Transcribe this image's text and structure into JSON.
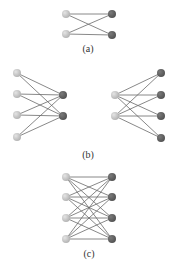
{
  "colors": {
    "background": "#ffffff",
    "edge": "#6a6a6a",
    "light_node": "#b5b5b5",
    "light_node_highlight": "#e4e4e4",
    "dark_node": "#545454",
    "dark_node_highlight": "#7a7a7a",
    "caption": "#333333"
  },
  "node_radius": 4,
  "panels": [
    {
      "id": "a",
      "caption": "(a)",
      "caption_pos": [
        88,
        45
      ],
      "light_nodes": [
        [
          66,
          14
        ],
        [
          66,
          34
        ]
      ],
      "dark_nodes": [
        [
          112,
          14
        ],
        [
          112,
          35
        ]
      ],
      "edges": "complete"
    },
    {
      "id": "b-left",
      "caption": "",
      "light_nodes": [
        [
          17,
          73
        ],
        [
          17,
          94
        ],
        [
          17,
          115
        ],
        [
          17,
          137
        ]
      ],
      "dark_nodes": [
        [
          63,
          95
        ],
        [
          63,
          116
        ]
      ],
      "edges": "complete"
    },
    {
      "id": "b-right",
      "caption": "",
      "light_nodes": [
        [
          115,
          95
        ],
        [
          115,
          116
        ]
      ],
      "dark_nodes": [
        [
          161,
          73
        ],
        [
          161,
          95
        ],
        [
          161,
          116
        ],
        [
          161,
          138
        ]
      ],
      "edges": "complete"
    },
    {
      "id": "b-caption",
      "caption": "(b)",
      "caption_pos": [
        88,
        151
      ],
      "light_nodes": [],
      "dark_nodes": [],
      "edges": "none"
    },
    {
      "id": "c",
      "caption": "(c)",
      "caption_pos": [
        89,
        250
      ],
      "light_nodes": [
        [
          66,
          177
        ],
        [
          66,
          197
        ],
        [
          66,
          218
        ],
        [
          66,
          239
        ]
      ],
      "dark_nodes": [
        [
          112,
          177
        ],
        [
          112,
          197
        ],
        [
          112,
          218
        ],
        [
          112,
          239
        ]
      ],
      "edges": "complete"
    }
  ],
  "captions": {
    "a": "(a)",
    "b": "(b)",
    "c": "(c)"
  }
}
